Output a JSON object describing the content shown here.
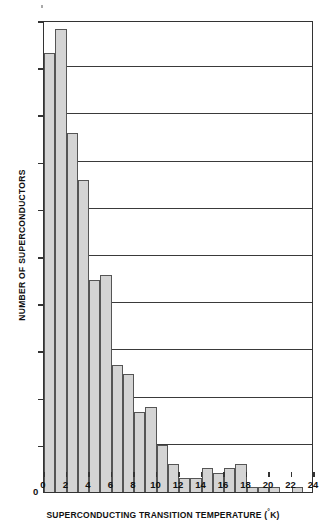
{
  "chart_data": {
    "type": "bar",
    "title": "",
    "xlabel": "SUPERCONDUCTING TRANSITION TEMPERATURE (°K)",
    "ylabel": "NUMBER OF SUPERCONDUCTORS",
    "xlim": [
      0,
      24
    ],
    "ylim": [
      0,
      100
    ],
    "xticks": [
      0,
      2,
      4,
      6,
      8,
      10,
      12,
      14,
      16,
      18,
      20,
      22,
      24
    ],
    "yticks": [
      0,
      10,
      20,
      30,
      40,
      50,
      60,
      70,
      80,
      90,
      100
    ],
    "grid": "horizontal",
    "legend": "none",
    "bin_width": 1,
    "bin_starts": [
      0,
      1,
      2,
      3,
      4,
      5,
      6,
      7,
      8,
      9,
      10,
      11,
      12,
      13,
      14,
      15,
      16,
      17,
      18,
      19,
      20,
      21,
      22,
      23
    ],
    "categories": [
      "0-1",
      "1-2",
      "2-3",
      "3-4",
      "4-5",
      "5-6",
      "6-7",
      "7-8",
      "8-9",
      "9-10",
      "10-11",
      "11-12",
      "12-13",
      "13-14",
      "14-15",
      "15-16",
      "16-17",
      "17-18",
      "18-19",
      "19-20",
      "20-21",
      "21-22",
      "22-23",
      "23-24"
    ],
    "values": [
      93,
      98,
      76,
      66,
      45,
      46,
      27,
      25,
      17,
      18,
      10,
      6,
      3,
      3,
      5,
      4,
      5,
      6,
      1,
      1,
      1,
      0,
      1,
      0
    ],
    "bar_fill": "#d4d4d4",
    "bar_edge": "#555555",
    "axis_color": "#333333",
    "background": "#ffffff"
  },
  "axes": {
    "y_tick_labels": [
      "100",
      "90",
      "80",
      "70",
      "60",
      "50",
      "40",
      "30",
      "20",
      "10",
      "0"
    ],
    "x_tick_labels": [
      "0",
      "2",
      "4",
      "6",
      "8",
      "10",
      "12",
      "14",
      "16",
      "18",
      "20",
      "22",
      "24"
    ],
    "y_title": "NUMBER OF SUPERCONDUCTORS",
    "x_title_main": "SUPERCONDUCTING TRANSITION TEMPERATURE (",
    "x_title_degree": "°",
    "x_title_tail": "K)",
    "origin_label": "0"
  }
}
